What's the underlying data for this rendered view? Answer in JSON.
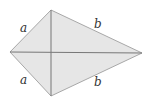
{
  "diagram": {
    "type": "kite",
    "fill_color": "#e6e6e6",
    "edge_color": "#9a9a9a",
    "diagonal_color": "#777777",
    "vertices": {
      "top": [
        51,
        10
      ],
      "left": [
        10,
        52
      ],
      "right": [
        142,
        53
      ],
      "bottom": [
        51,
        96
      ]
    },
    "labels": {
      "top_left": "a",
      "bottom_left": "a",
      "top_right": "b",
      "bottom_right": "b"
    }
  }
}
